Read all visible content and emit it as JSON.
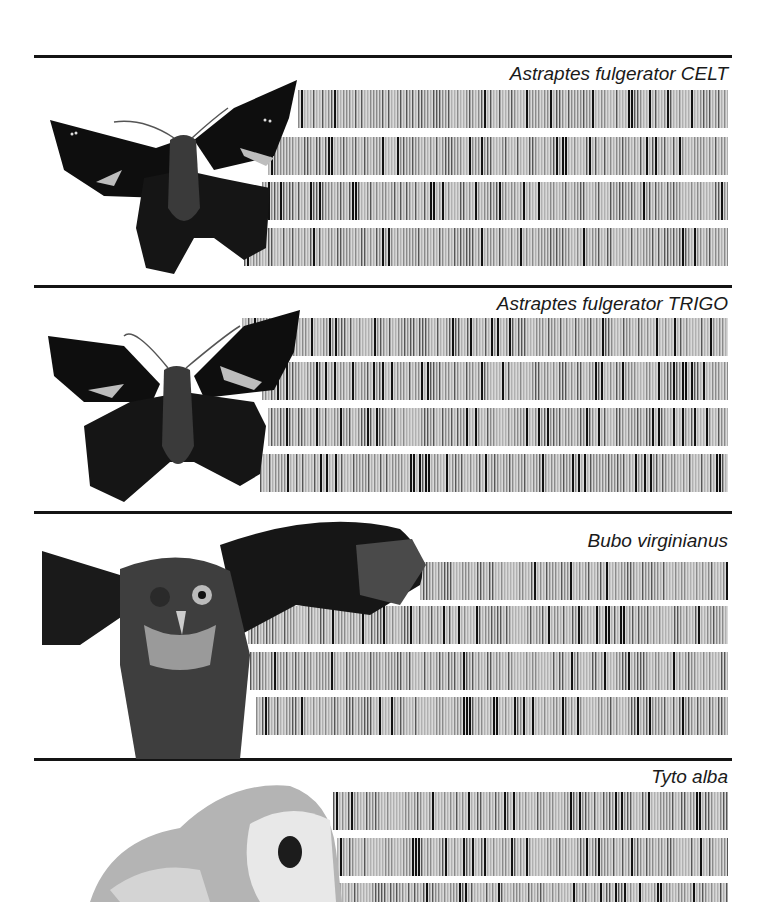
{
  "figure": {
    "panels": [
      {
        "species": "Astraptes fulgerator CELT",
        "image": "skipper-butterfly-dorsal",
        "rule_y": 55,
        "label_y": 63,
        "bars": [
          {
            "top": 90,
            "left": 298,
            "seed": 11
          },
          {
            "top": 137,
            "left": 268,
            "seed": 23
          },
          {
            "top": 182,
            "left": 262,
            "seed": 37
          },
          {
            "top": 228,
            "left": 244,
            "seed": 41
          }
        ]
      },
      {
        "species": "Astraptes fulgerator TRIGO",
        "image": "skipper-butterfly-dorsal",
        "rule_y": 285,
        "label_y": 293,
        "bars": [
          {
            "top": 318,
            "left": 242,
            "seed": 53
          },
          {
            "top": 362,
            "left": 262,
            "seed": 61
          },
          {
            "top": 408,
            "left": 268,
            "seed": 73
          },
          {
            "top": 454,
            "left": 260,
            "seed": 89
          }
        ]
      },
      {
        "species": "Bubo virginianus",
        "image": "great-horned-owl",
        "rule_y": 511,
        "label_y": 530,
        "bars": [
          {
            "top": 562,
            "left": 420,
            "seed": 97
          },
          {
            "top": 606,
            "left": 248,
            "seed": 103
          },
          {
            "top": 652,
            "left": 250,
            "seed": 117
          },
          {
            "top": 697,
            "left": 256,
            "seed": 131
          }
        ]
      },
      {
        "species": "Tyto alba",
        "image": "barn-owl",
        "rule_y": 758,
        "label_y": 766,
        "bars": [
          {
            "top": 792,
            "left": 333,
            "seed": 139
          },
          {
            "top": 838,
            "left": 337,
            "seed": 151
          },
          {
            "top": 883,
            "left": 330,
            "seed": 163
          }
        ]
      }
    ]
  },
  "labels": {
    "p0": "Astraptes fulgerator CELT",
    "p1": "Astraptes fulgerator TRIGO",
    "p2": "Bubo virginianus",
    "p3": "Tyto alba"
  }
}
